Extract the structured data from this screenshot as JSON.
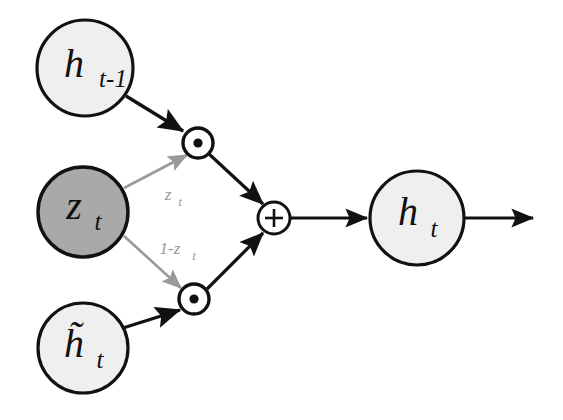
{
  "diagram": {
    "colors": {
      "node_light_fill": "#efefef",
      "node_dark_fill": "#a9a9a9",
      "node_stroke": "#111111",
      "arrow_dark": "#111111",
      "arrow_gray": "#9a9a9a",
      "background": "#ffffff"
    },
    "nodes": [
      {
        "id": "h-prev",
        "name": "h-prev-node",
        "base": "h",
        "sub": "t-1",
        "fill": "light",
        "cx": 85,
        "cy": 68,
        "r": 48
      },
      {
        "id": "z-t",
        "name": "z-t-node",
        "base": "z",
        "sub": "t",
        "fill": "dark",
        "cx": 83,
        "cy": 212,
        "r": 45
      },
      {
        "id": "h-cand",
        "name": "h-candidate-node",
        "base": "h̃",
        "sub": "t",
        "fill": "light",
        "cx": 83,
        "cy": 348,
        "r": 45
      },
      {
        "id": "h-out",
        "name": "h-t-node",
        "base": "h",
        "sub": "t",
        "fill": "light",
        "cx": 417,
        "cy": 218,
        "r": 47
      }
    ],
    "operators": [
      {
        "id": "mul-top",
        "name": "elementwise-multiply-top",
        "glyph": "⊙",
        "symbol": "dot",
        "cx": 198,
        "cy": 143,
        "r": 15
      },
      {
        "id": "mul-bottom",
        "name": "elementwise-multiply-bottom",
        "glyph": "⊙",
        "symbol": "dot",
        "cx": 194,
        "cy": 299,
        "r": 15
      },
      {
        "id": "add",
        "name": "addition-operator",
        "glyph": "+",
        "symbol": "plus",
        "cx": 274,
        "cy": 218,
        "r": 16
      }
    ],
    "edge_labels": [
      {
        "id": "z-gate-label",
        "name": "gate-weight-label-z",
        "text": "z",
        "sub": "t",
        "x": 171,
        "y": 196
      },
      {
        "id": "one-minus-z-label",
        "name": "gate-weight-label-one-minus-z",
        "text": "1-z",
        "sub": "t",
        "x": 174,
        "y": 250
      }
    ],
    "edges": [
      {
        "id": "e1",
        "name": "edge-h-prev-to-mul-top",
        "style": "dark"
      },
      {
        "id": "e2",
        "name": "edge-z-to-mul-top",
        "style": "gray"
      },
      {
        "id": "e3",
        "name": "edge-z-to-mul-bottom",
        "style": "gray"
      },
      {
        "id": "e4",
        "name": "edge-h-cand-to-mul-bottom",
        "style": "dark"
      },
      {
        "id": "e5",
        "name": "edge-mul-top-to-add",
        "style": "dark"
      },
      {
        "id": "e6",
        "name": "edge-mul-bottom-to-add",
        "style": "dark"
      },
      {
        "id": "e7",
        "name": "edge-add-to-h-out",
        "style": "dark"
      },
      {
        "id": "e8",
        "name": "edge-h-out-to-output",
        "style": "dark"
      }
    ]
  }
}
